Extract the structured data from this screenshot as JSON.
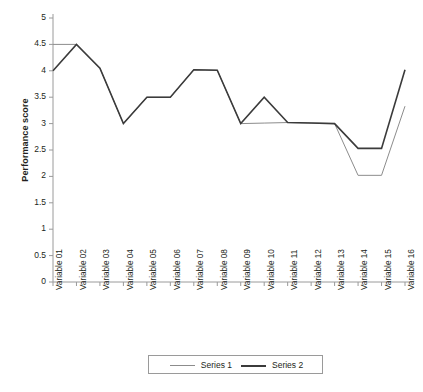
{
  "chart_data": {
    "type": "line",
    "title": "",
    "xlabel": "",
    "ylabel": "Performance score",
    "ylim": [
      0,
      5
    ],
    "ytick_step": 0.5,
    "yticks": [
      "5",
      "4.5",
      "4",
      "3.5",
      "3",
      "2.5",
      "2",
      "1.5",
      "1",
      "0.5",
      "0"
    ],
    "grid": false,
    "legend_position": "bottom",
    "categories": [
      "Variable 01",
      "Variable 02",
      "Variable 03",
      "Variable 04",
      "Variable 05",
      "Variable 06",
      "Variable 07",
      "Variable 08",
      "Variable 09",
      "Variable 10",
      "Variable 11",
      "Variable 12",
      "Variable 13",
      "Variable 14",
      "Variable 15",
      "Variable 16"
    ],
    "series": [
      {
        "name": "Series 1",
        "color": "#8c8c8c",
        "width": 1,
        "values": [
          4.5,
          4.5,
          4.05,
          3.0,
          3.5,
          3.5,
          4.02,
          4.01,
          3.0,
          3.01,
          3.02,
          3.01,
          3.0,
          2.02,
          2.02,
          3.33
        ]
      },
      {
        "name": "Series 2",
        "color": "#3b3b3b",
        "width": 1.6,
        "values": [
          4.0,
          4.5,
          4.05,
          3.0,
          3.5,
          3.5,
          4.02,
          4.01,
          3.0,
          3.5,
          3.02,
          3.01,
          3.0,
          2.53,
          2.53,
          4.02
        ]
      }
    ]
  },
  "legend": {
    "items": [
      {
        "label": "Series 1"
      },
      {
        "label": "Series 2"
      }
    ]
  },
  "axis": {
    "line_color": "#9a9a9a",
    "y_title": "Performance score"
  }
}
